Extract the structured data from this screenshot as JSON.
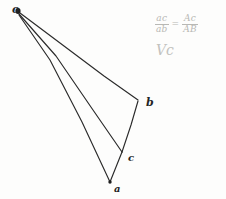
{
  "figure": {
    "type": "hand-drawn-geometry-sketch",
    "background_color": "#fdfdfc",
    "ink_color": "#242424",
    "annotation_color": "#b8b8b4",
    "width": 226,
    "height": 199
  },
  "vertices": [
    {
      "id": "o",
      "label": "o",
      "x": 18,
      "y": 11
    },
    {
      "id": "b",
      "label": "b",
      "x": 138,
      "y": 100
    },
    {
      "id": "c",
      "label": "c",
      "x": 122,
      "y": 152
    },
    {
      "id": "a",
      "label": "a",
      "x": 110,
      "y": 182
    }
  ],
  "edges": [
    {
      "id": "o-b",
      "from": "o",
      "to": "b"
    },
    {
      "id": "o-c",
      "from": "o",
      "to": "c"
    },
    {
      "id": "o-a",
      "from": "o",
      "to": "a"
    },
    {
      "id": "b-c",
      "from": "b",
      "to": "c"
    },
    {
      "id": "c-a",
      "from": "c",
      "to": "a"
    }
  ],
  "annotation": {
    "equation": {
      "left": {
        "numerator": "ac",
        "denominator": "ab"
      },
      "operator": "=",
      "right": {
        "numerator": "Ac",
        "denominator": "AB"
      }
    },
    "note": "Vc"
  }
}
